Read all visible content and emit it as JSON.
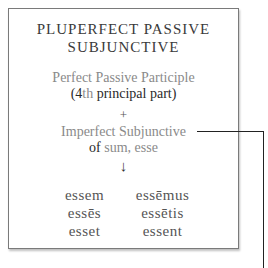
{
  "card": {
    "title_line1": "PLUPERFECT PASSIVE",
    "title_line2": "SUBJUNCTIVE",
    "participle": "Perfect Passive Participle",
    "part_open": "(4",
    "part_th": "th",
    "part_rest": " principal part)",
    "plus": "+",
    "imperfect": "Imperfect Subjunctive",
    "of": "of ",
    "verb": "sum, esse",
    "arrow": "↓",
    "forms": [
      [
        "essem",
        "essēmus"
      ],
      [
        "essēs",
        "essētis"
      ],
      [
        "esset",
        "essent"
      ]
    ]
  },
  "connector": {
    "color": "#222222"
  },
  "colors": {
    "border": "#7a7a7a",
    "gray_text": "#8a8a8a",
    "dark_text": "#2a2a2a"
  }
}
